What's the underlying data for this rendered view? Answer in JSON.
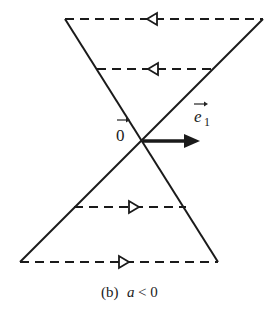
{
  "diagram": {
    "caption_prefix": "(b)",
    "caption_var": "a",
    "caption_rel": "< 0",
    "origin_label": "0",
    "vector_label": "e",
    "vector_subscript": "1",
    "line_color": "#1a1a1a",
    "flow_directions": {
      "upper_region": "left",
      "lower_region": "right"
    },
    "dashed_lines": [
      {
        "position": "top",
        "arrow": "left"
      },
      {
        "position": "upper-middle",
        "arrow": "left"
      },
      {
        "position": "lower-middle",
        "arrow": "right"
      },
      {
        "position": "bottom",
        "arrow": "right"
      }
    ]
  }
}
